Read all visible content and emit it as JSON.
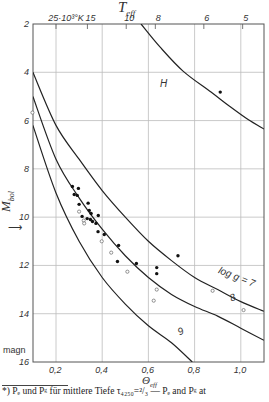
{
  "chart_data": {
    "type": "line",
    "title": "",
    "top_axis": {
      "label": "T_eff",
      "ticks": [
        {
          "label": "25·10³°K",
          "theta": 0.2
        },
        {
          "label": "15",
          "theta": 0.336
        },
        {
          "label": "10",
          "theta": 0.504
        },
        {
          "label": "8",
          "theta": 0.63
        },
        {
          "label": "6",
          "theta": 0.84
        },
        {
          "label": "5",
          "theta": 1.008
        }
      ]
    },
    "xlabel": "Θ_eff",
    "ylabel": "M_bol",
    "ylabel_unit": "magn",
    "xlim": [
      0.1,
      1.1
    ],
    "ylim": [
      2,
      16
    ],
    "y_inverted": true,
    "grid": true,
    "x_ticks": [
      "0,2",
      "0,4",
      "0,6",
      "0,8",
      "1,0"
    ],
    "x_tick_values": [
      0.2,
      0.4,
      0.6,
      0.8,
      1.0
    ],
    "y_ticks": [
      "2",
      "4",
      "6",
      "8",
      "10",
      "12",
      "14",
      "16"
    ],
    "y_tick_values": [
      2,
      4,
      6,
      8,
      10,
      12,
      14,
      16
    ],
    "series": [
      {
        "name": "H",
        "label_pos": [
          0.65,
          4.6
        ],
        "points": [
          [
            0.568,
            2.0
          ],
          [
            0.65,
            2.95
          ],
          [
            0.75,
            3.95
          ],
          [
            0.871,
            4.82
          ],
          [
            0.95,
            5.4
          ],
          [
            1.03,
            5.95
          ],
          [
            1.1,
            6.35
          ]
        ]
      },
      {
        "name": "log g = 7",
        "label_pos": [
          0.9,
          12.3
        ],
        "points": [
          [
            0.1,
            4.0
          ],
          [
            0.2,
            6.2
          ],
          [
            0.3,
            7.6
          ],
          [
            0.4,
            8.9
          ],
          [
            0.5,
            10.0
          ],
          [
            0.6,
            11.0
          ],
          [
            0.7,
            11.8
          ],
          [
            0.8,
            12.5
          ],
          [
            0.9,
            13.0
          ],
          [
            1.0,
            13.5
          ],
          [
            1.1,
            13.9
          ]
        ]
      },
      {
        "name": "8",
        "label_pos": [
          0.96,
          13.5
        ],
        "points": [
          [
            0.1,
            5.0
          ],
          [
            0.2,
            7.6
          ],
          [
            0.3,
            9.2
          ],
          [
            0.4,
            10.5
          ],
          [
            0.5,
            11.6
          ],
          [
            0.6,
            12.5
          ],
          [
            0.7,
            13.2
          ],
          [
            0.8,
            13.7
          ],
          [
            0.9,
            14.1
          ],
          [
            1.0,
            14.6
          ],
          [
            1.1,
            15.1
          ]
        ]
      },
      {
        "name": "9",
        "label_pos": [
          0.735,
          14.9
        ],
        "points": [
          [
            0.1,
            6.2
          ],
          [
            0.2,
            9.0
          ],
          [
            0.3,
            11.0
          ],
          [
            0.4,
            12.5
          ],
          [
            0.5,
            13.6
          ],
          [
            0.6,
            14.5
          ],
          [
            0.7,
            15.2
          ],
          [
            0.79,
            16.0
          ]
        ]
      }
    ],
    "scatter_filled": [
      [
        0.271,
        8.73
      ],
      [
        0.297,
        8.81
      ],
      [
        0.279,
        9.06
      ],
      [
        0.292,
        9.1
      ],
      [
        0.3,
        9.47
      ],
      [
        0.339,
        9.42
      ],
      [
        0.344,
        9.72
      ],
      [
        0.352,
        9.85
      ],
      [
        0.313,
        9.97
      ],
      [
        0.383,
        9.93
      ],
      [
        0.335,
        10.06
      ],
      [
        0.349,
        10.1
      ],
      [
        0.358,
        10.18
      ],
      [
        0.373,
        10.26
      ],
      [
        0.382,
        10.6
      ],
      [
        0.409,
        10.72
      ],
      [
        0.471,
        11.17
      ],
      [
        0.466,
        11.84
      ],
      [
        0.548,
        11.92
      ],
      [
        0.636,
        12.09
      ],
      [
        0.636,
        12.34
      ],
      [
        0.728,
        11.6
      ],
      [
        0.911,
        4.82
      ]
    ],
    "scatter_open": [
      [
        0.3,
        9.77
      ],
      [
        0.32,
        10.14
      ],
      [
        0.322,
        10.26
      ],
      [
        0.398,
        11.0
      ],
      [
        0.439,
        11.47
      ],
      [
        0.509,
        12.26
      ],
      [
        0.636,
        13.0
      ],
      [
        0.623,
        13.46
      ],
      [
        0.098,
        5.67
      ],
      [
        0.878,
        13.05
      ],
      [
        1.012,
        13.85
      ]
    ],
    "annotations": [
      "H",
      "log g = 7",
      "8",
      "9"
    ]
  },
  "labels": {
    "top_axis_title": "T",
    "top_axis_sub": "eff",
    "y_axis_main": "M",
    "y_axis_sub": "bol",
    "y_unit": "magn",
    "x_axis_main": "Θ",
    "x_axis_sub": "eff",
    "curve_H": "H",
    "curve_7": "log g = 7",
    "curve_8": "8",
    "curve_9": "9"
  },
  "footnote": "*) Pₑ und Pᵍ für mittlere Tiefe τ₄₂₅₀=²/₃  —  Pₑ and Pᵍ at"
}
